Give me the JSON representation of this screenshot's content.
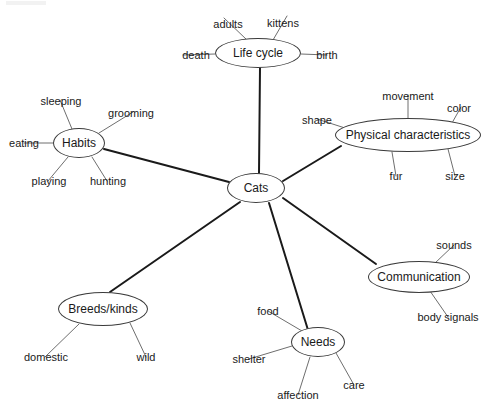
{
  "diagram": {
    "central_node": {
      "id": "cats",
      "label": "Cats",
      "cx": 256,
      "cy": 188,
      "rx": 29,
      "ry": 15
    },
    "style": {
      "background_color": "#ffffff",
      "node_border_color": "#3a3a3a",
      "node_fill_color": "#ffffff",
      "main_edge_color": "#1a1a1a",
      "leaf_edge_color": "#6e6e6e",
      "text_color": "#1a1a1a",
      "main_edge_width": 2,
      "leaf_edge_width": 1
    },
    "branches": [
      {
        "id": "life-cycle",
        "label": "Life cycle",
        "cx": 258,
        "cy": 53,
        "rx": 43,
        "ry": 15,
        "leaves": [
          {
            "label": "adults",
            "x": 224,
            "y": 18,
            "anchor_x": 247,
            "anchor_y": 40,
            "tx": 228,
            "ty": 24
          },
          {
            "label": "kittens",
            "x": 287,
            "y": 16,
            "anchor_x": 273,
            "anchor_y": 40,
            "tx": 283,
            "ty": 23
          },
          {
            "label": "death",
            "x": 183,
            "y": 55,
            "anchor_x": 215,
            "anchor_y": 54,
            "tx": 196,
            "ty": 55
          },
          {
            "label": "birth",
            "x": 327,
            "y": 55,
            "anchor_x": 301,
            "anchor_y": 54,
            "tx": 327,
            "ty": 55
          }
        ]
      },
      {
        "id": "habits",
        "label": "Habits",
        "cx": 79,
        "cy": 143,
        "rx": 26,
        "ry": 15,
        "leaves": [
          {
            "label": "sleeping",
            "x": 60,
            "y": 100,
            "anchor_x": 72,
            "anchor_y": 129,
            "tx": 61,
            "ty": 101
          },
          {
            "label": "grooming",
            "x": 133,
            "y": 112,
            "anchor_x": 99,
            "anchor_y": 133,
            "tx": 131,
            "ty": 113
          },
          {
            "label": "eating",
            "x": 24,
            "y": 143,
            "anchor_x": 53,
            "anchor_y": 143,
            "tx": 24,
            "ty": 143
          },
          {
            "label": "playing",
            "x": 48,
            "y": 181,
            "anchor_x": 68,
            "anchor_y": 157,
            "tx": 49,
            "ty": 181
          },
          {
            "label": "hunting",
            "x": 107,
            "y": 181,
            "anchor_x": 92,
            "anchor_y": 157,
            "tx": 108,
            "ty": 181
          }
        ]
      },
      {
        "id": "physical-characteristics",
        "label": "Physical characteristics",
        "cx": 408,
        "cy": 135,
        "rx": 73,
        "ry": 17,
        "leaves": [
          {
            "label": "movement",
            "x": 408,
            "y": 95,
            "anchor_x": 408,
            "anchor_y": 118,
            "tx": 408,
            "ty": 96
          },
          {
            "label": "color",
            "x": 461,
            "y": 107,
            "anchor_x": 452,
            "anchor_y": 123,
            "tx": 459,
            "ty": 108
          },
          {
            "label": "shape",
            "x": 317,
            "y": 119,
            "anchor_x": 345,
            "anchor_y": 128,
            "tx": 317,
            "ty": 120
          },
          {
            "label": "fur",
            "x": 396,
            "y": 176,
            "anchor_x": 392,
            "anchor_y": 152,
            "tx": 396,
            "ty": 176
          },
          {
            "label": "size",
            "x": 455,
            "y": 176,
            "anchor_x": 448,
            "anchor_y": 149,
            "tx": 455,
            "ty": 176
          }
        ]
      },
      {
        "id": "communication",
        "label": "Communication",
        "cx": 419,
        "cy": 277,
        "rx": 51,
        "ry": 16,
        "leaves": [
          {
            "label": "sounds",
            "x": 454,
            "y": 245,
            "anchor_x": 434,
            "anchor_y": 264,
            "tx": 454,
            "ty": 245
          },
          {
            "label": "body signals",
            "x": 448,
            "y": 317,
            "anchor_x": 430,
            "anchor_y": 291,
            "tx": 448,
            "ty": 317
          }
        ]
      },
      {
        "id": "needs",
        "label": "Needs",
        "cx": 318,
        "cy": 342,
        "rx": 27,
        "ry": 15,
        "leaves": [
          {
            "label": "food",
            "x": 268,
            "y": 311,
            "anchor_x": 302,
            "anchor_y": 331,
            "tx": 268,
            "ty": 311
          },
          {
            "label": "shelter",
            "x": 249,
            "y": 359,
            "anchor_x": 292,
            "anchor_y": 346,
            "tx": 249,
            "ty": 359
          },
          {
            "label": "affection",
            "x": 298,
            "y": 395,
            "anchor_x": 310,
            "anchor_y": 357,
            "tx": 298,
            "ty": 395
          },
          {
            "label": "care",
            "x": 354,
            "y": 385,
            "anchor_x": 336,
            "anchor_y": 353,
            "tx": 354,
            "ty": 385
          }
        ]
      },
      {
        "id": "breeds-kinds",
        "label": "Breeds/kinds",
        "cx": 103,
        "cy": 309,
        "rx": 45,
        "ry": 17,
        "leaves": [
          {
            "label": "domestic",
            "x": 45,
            "y": 357,
            "anchor_x": 79,
            "anchor_y": 324,
            "tx": 46,
            "ty": 357
          },
          {
            "label": "wild",
            "x": 146,
            "y": 357,
            "anchor_x": 130,
            "anchor_y": 323,
            "tx": 146,
            "ty": 357
          }
        ]
      }
    ],
    "main_edges": [
      {
        "from": "cats",
        "to": "life-cycle",
        "x1": 259,
        "y1": 173,
        "x2": 260,
        "y2": 68
      },
      {
        "from": "cats",
        "to": "habits",
        "x1": 229,
        "y1": 182,
        "x2": 104,
        "y2": 149
      },
      {
        "from": "cats",
        "to": "physical-characteristics",
        "x1": 283,
        "y1": 181,
        "x2": 341,
        "y2": 146
      },
      {
        "from": "cats",
        "to": "communication",
        "x1": 283,
        "y1": 198,
        "x2": 376,
        "y2": 264
      },
      {
        "from": "cats",
        "to": "needs",
        "x1": 269,
        "y1": 203,
        "x2": 308,
        "y2": 330
      },
      {
        "from": "cats",
        "to": "breeds-kinds",
        "x1": 240,
        "y1": 202,
        "x2": 110,
        "y2": 292
      }
    ]
  }
}
